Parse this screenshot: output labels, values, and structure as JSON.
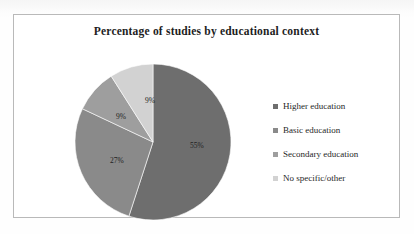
{
  "chart_data": {
    "type": "pie",
    "title": "Percentage of studies by educational context",
    "categories": [
      "Higher education",
      "Basic education",
      "Secondary education",
      "No specific/other"
    ],
    "values": [
      55,
      27,
      9,
      9
    ],
    "data_labels": [
      "55%",
      "9%",
      "9%",
      "27%"
    ],
    "unit": "%",
    "start_angle_deg": 0,
    "direction": "clockwise",
    "legend_position": "right",
    "grid": false,
    "xlabel": "",
    "ylabel": "",
    "slice_colors": [
      "#6e6e6e",
      "#8a8a8a",
      "#9e9e9e",
      "#d2d2d2"
    ],
    "slices": [
      {
        "label": "Higher education",
        "value": 55,
        "data_label": "55%",
        "color": "#6e6e6e"
      },
      {
        "label": "Basic education",
        "value": 27,
        "data_label": "27%",
        "color": "#8a8a8a"
      },
      {
        "label": "Secondary education",
        "value": 9,
        "data_label": "9%",
        "color": "#9e9e9e"
      },
      {
        "label": "No specific/other",
        "value": 9,
        "data_label": "9%",
        "color": "#d2d2d2"
      }
    ]
  },
  "frame": {
    "border_color": "#b9b9b9",
    "background": "#ffffff"
  }
}
